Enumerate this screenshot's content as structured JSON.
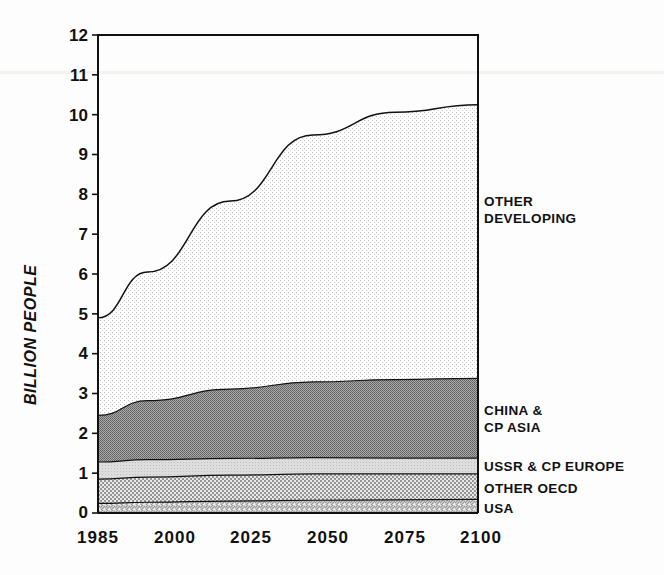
{
  "axis": {
    "y_title": "BILLION PEOPLE",
    "y_ticks": [
      "12",
      "11",
      "10",
      "9",
      "8",
      "7",
      "6",
      "5",
      "4",
      "3",
      "2",
      "1",
      "0"
    ],
    "x_ticks": [
      "1985",
      "2000",
      "2025",
      "2050",
      "2075",
      "2100"
    ]
  },
  "legend": {
    "other_developing_line1": "OTHER",
    "other_developing_line2": "DEVELOPING",
    "china_line1": "CHINA &",
    "china_line2": "CP ASIA",
    "ussr": "USSR & CP EUROPE",
    "other_oecd": "OTHER OECD",
    "usa": "USA"
  },
  "colors": {
    "ink": "#111111",
    "other_developing_fill": "#fbfbfb",
    "china_fill": "#8e8e8e",
    "ussr_fill": "#d6d6d6",
    "other_oecd_fill": "#bdbdbd",
    "usa_fill": "#e4e4e4"
  },
  "chart_data": {
    "type": "area",
    "stacked": true,
    "title": "",
    "xlabel": "",
    "ylabel": "BILLION PEOPLE",
    "x": [
      1985,
      2000,
      2025,
      2050,
      2075,
      2100
    ],
    "xlim": [
      1985,
      2100
    ],
    "ylim": [
      0,
      12
    ],
    "ytick_step": 1,
    "grid": false,
    "legend_position": "right-inline",
    "units": "billion people",
    "series": [
      {
        "name": "USA",
        "values": [
          0.24,
          0.27,
          0.3,
          0.32,
          0.33,
          0.34
        ]
      },
      {
        "name": "OTHER OECD",
        "values": [
          0.61,
          0.63,
          0.65,
          0.66,
          0.65,
          0.64
        ]
      },
      {
        "name": "USSR & CP EUROPE",
        "values": [
          0.43,
          0.44,
          0.42,
          0.41,
          0.4,
          0.4
        ]
      },
      {
        "name": "CHINA & CP ASIA",
        "values": [
          1.17,
          1.48,
          1.74,
          1.9,
          1.97,
          2.0
        ]
      },
      {
        "name": "OTHER DEVELOPING",
        "values": [
          2.45,
          3.23,
          4.72,
          6.2,
          6.71,
          6.87
        ]
      }
    ],
    "cumulative_totals": {
      "USA": [
        0.24,
        0.27,
        0.3,
        0.32,
        0.33,
        0.34
      ],
      "OTHER OECD": [
        0.85,
        0.9,
        0.95,
        0.98,
        0.98,
        0.98
      ],
      "USSR & CP EUROPE": [
        1.28,
        1.34,
        1.37,
        1.39,
        1.38,
        1.38
      ],
      "CHINA & CP ASIA": [
        2.45,
        2.82,
        3.11,
        3.29,
        3.35,
        3.38
      ],
      "TOTAL": [
        4.9,
        6.05,
        7.83,
        9.49,
        10.06,
        10.25
      ]
    }
  }
}
